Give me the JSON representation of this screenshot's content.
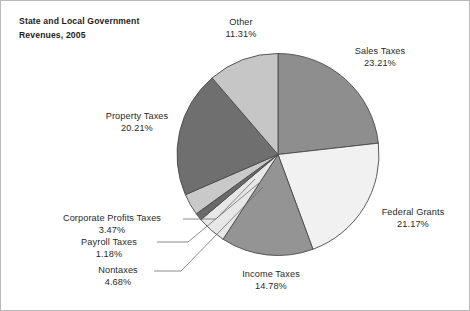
{
  "figure": {
    "title": "State and Local Government\nRevenues, 2005",
    "border_color": "#b9b9b9",
    "background": "#ffffff"
  },
  "chart_data": {
    "type": "pie",
    "title": "State and Local Government Revenues, 2005",
    "xlabel": "",
    "ylabel": "",
    "units": "percent",
    "start_angle_deg": 0,
    "direction": "clockwise",
    "legend": "none",
    "grid": false,
    "categories": [
      "Sales Taxes",
      "Federal Grants",
      "Income Taxes",
      "Nontaxes",
      "Payroll Taxes",
      "Corporate Profits Taxes",
      "Property Taxes",
      "Other"
    ],
    "values": [
      23.21,
      21.17,
      14.78,
      4.68,
      1.18,
      3.47,
      20.21,
      11.31
    ],
    "labels": [
      "23.21%",
      "21.17%",
      "14.78%",
      "4.68%",
      "1.18%",
      "3.47%",
      "20.21%",
      "11.31%"
    ],
    "colors": [
      "#8e8e8e",
      "#f1f1f1",
      "#949494",
      "#e7e7e7",
      "#6a6a6a",
      "#c9c9c9",
      "#6f6f6f",
      "#c6c6c6"
    ],
    "slice_edge_color": "#4a4a4a",
    "slices": [
      {
        "name": "Sales Taxes",
        "value": 23.21,
        "label": "Sales Taxes",
        "percent": "23.21%",
        "color": "#8e8e8e"
      },
      {
        "name": "Federal Grants",
        "value": 21.17,
        "label": "Federal Grants",
        "percent": "21.17%",
        "color": "#f1f1f1"
      },
      {
        "name": "Income Taxes",
        "value": 14.78,
        "label": "Income Taxes",
        "percent": "14.78%",
        "color": "#949494"
      },
      {
        "name": "Nontaxes",
        "value": 4.68,
        "label": "Nontaxes",
        "percent": "4.68%",
        "color": "#e7e7e7"
      },
      {
        "name": "Payroll Taxes",
        "value": 1.18,
        "label": "Payroll Taxes",
        "percent": "1.18%",
        "color": "#6a6a6a"
      },
      {
        "name": "Corporate Profits Taxes",
        "value": 3.47,
        "label": "Corporate Profits Taxes",
        "percent": "3.47%",
        "color": "#c9c9c9"
      },
      {
        "name": "Property Taxes",
        "value": 20.21,
        "label": "Property  Taxes",
        "percent": "20.21%",
        "color": "#6f6f6f"
      },
      {
        "name": "Other",
        "value": 11.31,
        "label": "Other",
        "percent": "11.31%",
        "color": "#c6c6c6"
      }
    ]
  }
}
